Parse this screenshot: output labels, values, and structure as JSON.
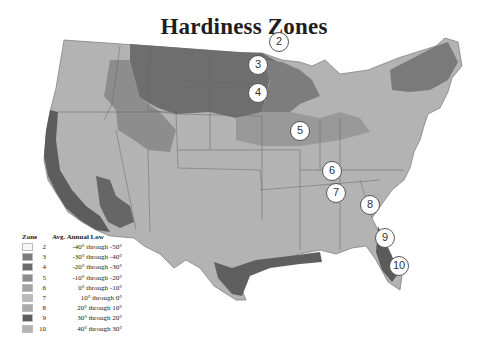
{
  "title": "Hardiness Zones",
  "legend": {
    "zone_header": "Zone",
    "range_header": "Avg. Annual Low",
    "items": [
      {
        "zone": "2",
        "range": "-40° through -50°",
        "color": "#f7f7f7"
      },
      {
        "zone": "3",
        "range": "-30° through -40°",
        "color": "#7a7a7a"
      },
      {
        "zone": "4",
        "range": "-20° through -30°",
        "color": "#6a6a6a"
      },
      {
        "zone": "5",
        "range": "-10° through -20°",
        "color": "#8c8c8c"
      },
      {
        "zone": "6",
        "range": "0° through -10°",
        "color": "#a4a4a4"
      },
      {
        "zone": "7",
        "range": "10° through 0°",
        "color": "#bababa"
      },
      {
        "zone": "8",
        "range": "20° through 10°",
        "color": "#aaaaaa"
      },
      {
        "zone": "9",
        "range": "30° through 20°",
        "color": "#5e5e5e"
      },
      {
        "zone": "10",
        "range": "40° through 30°",
        "color": "#b4b4b4"
      }
    ]
  },
  "markers": [
    {
      "label": "2",
      "x": 279,
      "y": 42
    },
    {
      "label": "3",
      "x": 258,
      "y": 65
    },
    {
      "label": "4",
      "x": 258,
      "y": 93
    },
    {
      "label": "5",
      "x": 300,
      "y": 131
    },
    {
      "label": "6",
      "x": 332,
      "y": 171
    },
    {
      "label": "7",
      "x": 336,
      "y": 193
    },
    {
      "label": "8",
      "x": 370,
      "y": 205
    },
    {
      "label": "9",
      "x": 385,
      "y": 238
    },
    {
      "label": "10",
      "x": 399,
      "y": 266
    }
  ]
}
